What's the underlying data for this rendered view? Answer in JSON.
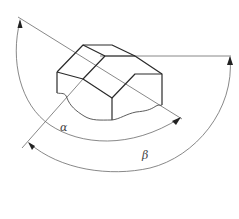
{
  "figure": {
    "type": "technical-drawing",
    "labels": {
      "alpha": "α",
      "beta": "β"
    },
    "colors": {
      "line": "#2a2a2a",
      "thin_line": "#6a6a6a",
      "background": "#ffffff"
    }
  }
}
